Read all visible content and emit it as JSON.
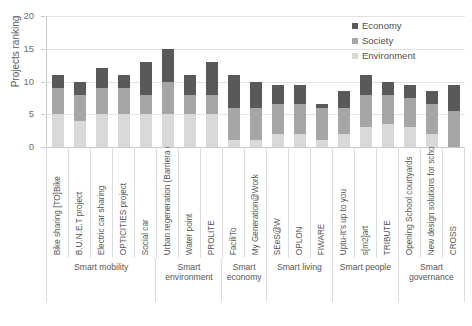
{
  "chart_data": {
    "type": "bar",
    "title": "",
    "subtitle": "",
    "xlabel": "",
    "ylabel": "Projects ranking",
    "ylim": [
      0,
      20
    ],
    "yticks": [
      0,
      5,
      10,
      15,
      20
    ],
    "grid": true,
    "stacked": true,
    "legend_position": "top-right",
    "categories": [
      "Bike sharing [TO]Bike",
      "B.U.N.E.T project",
      "Electric car sharing",
      "OPTICITIES project",
      "Social car",
      "Urban regeneration (Barriera di ...",
      "Water point",
      "PROLITE",
      "FaciliTo",
      "My Generation@Work",
      "SEeS@W",
      "OPLON",
      "FIWARE",
      "Uptu-It's up to you",
      "s[m2]art",
      "TRIBUTE",
      "Opening School courtyards",
      "New design solutions for school ...",
      "CROSS"
    ],
    "series": [
      {
        "name": "Environment",
        "color": "#d9d9d9",
        "values": [
          5,
          4,
          5,
          5,
          5,
          5,
          5,
          5,
          1,
          1,
          2,
          2,
          1,
          2,
          3,
          3.5,
          3,
          2,
          0
        ]
      },
      {
        "name": "Society",
        "color": "#a6a6a6",
        "values": [
          4,
          4,
          4,
          4,
          3,
          5,
          3,
          3,
          5,
          5,
          4.5,
          4.5,
          5,
          4,
          5,
          4.5,
          4.5,
          4.5,
          5.5
        ]
      },
      {
        "name": "Economy",
        "color": "#595959",
        "values": [
          2,
          2,
          3,
          2,
          5,
          5,
          3,
          5,
          5,
          4,
          3,
          3,
          0.5,
          2.5,
          3,
          2,
          2,
          2,
          4
        ]
      }
    ],
    "totals": [
      11,
      10,
      12,
      11,
      13,
      15,
      11,
      13,
      11,
      10,
      9.5,
      9.5,
      6.5,
      8.5,
      11,
      10,
      9.5,
      8.5,
      9.5
    ],
    "groups": [
      {
        "label": "Smart mobility",
        "span": 5
      },
      {
        "label": "Smart environment",
        "span": 3
      },
      {
        "label": "Smart economy",
        "span": 2
      },
      {
        "label": "Smart living",
        "span": 3
      },
      {
        "label": "Smart people",
        "span": 3
      },
      {
        "label": "Smart governance",
        "span": 3
      }
    ]
  },
  "legend": {
    "items": [
      {
        "label": "Economy",
        "color": "#595959"
      },
      {
        "label": "Society",
        "color": "#a6a6a6"
      },
      {
        "label": "Environment",
        "color": "#d9d9d9"
      }
    ]
  },
  "axes": {
    "y_title": "Projects ranking",
    "y_tick_labels": [
      "20",
      "15",
      "10",
      "5",
      "0"
    ]
  }
}
